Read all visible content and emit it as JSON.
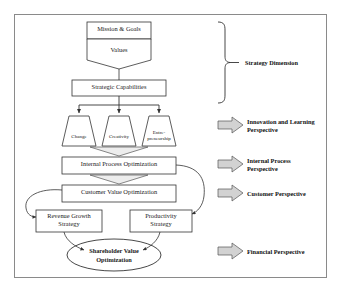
{
  "diagram": {
    "border_color": "#8a8a8a",
    "arrow_fill": "#d2d2d2",
    "arrow_stroke": "#555555",
    "shape_stroke": "#333333",
    "shape_fill": "#ffffff"
  },
  "nodes": {
    "mission": {
      "label": "Mission & Goals",
      "shape": "rectangle"
    },
    "values": {
      "label": "Values",
      "shape": "chevron-pentagon"
    },
    "capabilities": {
      "label": "Strategic Capabilities",
      "shape": "rectangle"
    },
    "change": {
      "label": "Change",
      "shape": "trapezoid"
    },
    "creativity": {
      "label": "Creativity",
      "shape": "trapezoid"
    },
    "entrepreneurship": {
      "label_line1": "Entre-",
      "label_line2": "preneurship",
      "shape": "trapezoid"
    },
    "internal_process": {
      "label": "Internal Process Optimization",
      "shape": "rectangle"
    },
    "customer_value": {
      "label": "Customer Value Optimization",
      "shape": "rectangle"
    },
    "revenue_growth": {
      "label_line1": "Revenue Growth",
      "label_line2": "Strategy",
      "shape": "rectangle"
    },
    "productivity": {
      "label_line1": "Productivity",
      "label_line2": "Strategy",
      "shape": "rectangle"
    },
    "shareholder": {
      "label_line1": "Shareholder Value",
      "label_line2": "Optimization",
      "shape": "ellipse"
    }
  },
  "perspectives": [
    {
      "id": "strategy-dimension",
      "label": "Strategy Dimension",
      "marker": "brace"
    },
    {
      "id": "innovation-learning",
      "label": "Innovation and Learning\nPerspective",
      "marker": "block-arrow"
    },
    {
      "id": "internal-process",
      "label": "Internal Process\nPerspective",
      "marker": "block-arrow"
    },
    {
      "id": "customer",
      "label": "Customer Perspective",
      "marker": "block-arrow"
    },
    {
      "id": "financial",
      "label": "Financial Perspective",
      "marker": "block-arrow"
    }
  ]
}
